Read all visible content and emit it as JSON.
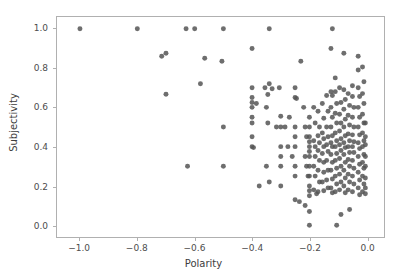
{
  "chart_data": {
    "type": "scatter",
    "title": "",
    "xlabel": "Polarity",
    "ylabel": "Subjectivity",
    "xlim": [
      -1.08,
      0.06
    ],
    "ylim": [
      -0.06,
      1.06
    ],
    "xticks": [
      -1.0,
      -0.8,
      -0.6,
      -0.4,
      -0.2,
      0.0
    ],
    "xticklabels": [
      "−1.0",
      "−0.8",
      "−0.6",
      "−0.4",
      "−0.2",
      "0.0"
    ],
    "yticks": [
      0.0,
      0.2,
      0.4,
      0.6,
      0.8,
      1.0
    ],
    "yticklabels": [
      "0.0",
      "0.2",
      "0.4",
      "0.6",
      "0.8",
      "1.0"
    ],
    "grid": false,
    "legend": null,
    "marker": {
      "shape": "circle",
      "color": "#555555",
      "size": 5,
      "opacity": 0.85
    },
    "series": [
      {
        "name": "reviews",
        "color": "#555555",
        "points": [
          [
            -1.0,
            1.0
          ],
          [
            -0.8,
            1.0
          ],
          [
            -0.63,
            1.0
          ],
          [
            -0.6,
            1.0
          ],
          [
            -0.5,
            1.0
          ],
          [
            -0.34,
            1.0
          ],
          [
            -0.12,
            1.0
          ],
          [
            -0.715,
            0.86
          ],
          [
            -0.7,
            0.875
          ],
          [
            -0.7,
            0.667
          ],
          [
            -0.565,
            0.85
          ],
          [
            -0.58,
            0.72
          ],
          [
            -0.505,
            0.835
          ],
          [
            -0.5,
            0.5
          ],
          [
            -0.625,
            0.3
          ],
          [
            -0.5,
            0.3
          ],
          [
            -0.4,
            0.9
          ],
          [
            -0.4,
            0.7
          ],
          [
            -0.4,
            0.65
          ],
          [
            -0.4,
            0.625
          ],
          [
            -0.4,
            0.6
          ],
          [
            -0.385,
            0.62
          ],
          [
            -0.4,
            0.55
          ],
          [
            -0.4,
            0.52
          ],
          [
            -0.4,
            0.45
          ],
          [
            -0.4,
            0.4
          ],
          [
            -0.395,
            0.395
          ],
          [
            -0.375,
            0.2
          ],
          [
            -0.355,
            0.7
          ],
          [
            -0.34,
            0.72
          ],
          [
            -0.33,
            0.695
          ],
          [
            -0.345,
            0.665
          ],
          [
            -0.35,
            0.6
          ],
          [
            -0.305,
            0.7
          ],
          [
            -0.3,
            0.555
          ],
          [
            -0.3,
            0.5
          ],
          [
            -0.315,
            0.5
          ],
          [
            -0.345,
            0.52
          ],
          [
            -0.35,
            0.3
          ],
          [
            -0.34,
            0.22
          ],
          [
            -0.3,
            0.4
          ],
          [
            -0.3,
            0.35
          ],
          [
            -0.3,
            0.3
          ],
          [
            -0.3,
            0.2
          ],
          [
            -0.285,
            0.5
          ],
          [
            -0.27,
            0.55
          ],
          [
            -0.275,
            0.4
          ],
          [
            -0.26,
            0.35
          ],
          [
            -0.25,
            0.7
          ],
          [
            -0.25,
            0.65
          ],
          [
            -0.245,
            0.645
          ],
          [
            -0.25,
            0.5
          ],
          [
            -0.25,
            0.45
          ],
          [
            -0.25,
            0.4
          ],
          [
            -0.25,
            0.3
          ],
          [
            -0.25,
            0.25
          ],
          [
            -0.25,
            0.13
          ],
          [
            -0.23,
            0.835
          ],
          [
            -0.235,
            0.12
          ],
          [
            -0.22,
            0.6
          ],
          [
            -0.215,
            0.5
          ],
          [
            -0.21,
            0.45
          ],
          [
            -0.215,
            0.35
          ],
          [
            -0.21,
            0.3
          ],
          [
            -0.205,
            0.25
          ],
          [
            -0.215,
            0.1
          ],
          [
            -0.2,
            0.55
          ],
          [
            -0.2,
            0.5
          ],
          [
            -0.2,
            0.45
          ],
          [
            -0.2,
            0.425
          ],
          [
            -0.2,
            0.4
          ],
          [
            -0.2,
            0.375
          ],
          [
            -0.2,
            0.35
          ],
          [
            -0.2,
            0.3
          ],
          [
            -0.2,
            0.25
          ],
          [
            -0.2,
            0.2
          ],
          [
            -0.2,
            0.175
          ],
          [
            -0.2,
            0.15
          ],
          [
            -0.2,
            0.07
          ],
          [
            -0.2,
            0.0
          ],
          [
            -0.185,
            0.6
          ],
          [
            -0.18,
            0.52
          ],
          [
            -0.185,
            0.43
          ],
          [
            -0.18,
            0.4
          ],
          [
            -0.18,
            0.35
          ],
          [
            -0.185,
            0.3
          ],
          [
            -0.18,
            0.25
          ],
          [
            -0.185,
            0.18
          ],
          [
            -0.175,
            0.16
          ],
          [
            -0.17,
            0.58
          ],
          [
            -0.165,
            0.5
          ],
          [
            -0.17,
            0.455
          ],
          [
            -0.165,
            0.42
          ],
          [
            -0.17,
            0.38
          ],
          [
            -0.165,
            0.33
          ],
          [
            -0.17,
            0.28
          ],
          [
            -0.165,
            0.22
          ],
          [
            -0.17,
            0.17
          ],
          [
            -0.155,
            0.62
          ],
          [
            -0.15,
            0.545
          ],
          [
            -0.155,
            0.47
          ],
          [
            -0.15,
            0.44
          ],
          [
            -0.15,
            0.4
          ],
          [
            -0.155,
            0.365
          ],
          [
            -0.15,
            0.32
          ],
          [
            -0.15,
            0.27
          ],
          [
            -0.155,
            0.22
          ],
          [
            -0.15,
            0.175
          ],
          [
            -0.14,
            0.66
          ],
          [
            -0.135,
            0.58
          ],
          [
            -0.14,
            0.5
          ],
          [
            -0.135,
            0.45
          ],
          [
            -0.14,
            0.41
          ],
          [
            -0.135,
            0.375
          ],
          [
            -0.14,
            0.33
          ],
          [
            -0.135,
            0.28
          ],
          [
            -0.14,
            0.23
          ],
          [
            -0.135,
            0.19
          ],
          [
            -0.125,
            0.9
          ],
          [
            -0.125,
            0.68
          ],
          [
            -0.12,
            0.66
          ],
          [
            -0.125,
            0.6
          ],
          [
            -0.12,
            0.55
          ],
          [
            -0.125,
            0.5
          ],
          [
            -0.12,
            0.455
          ],
          [
            -0.125,
            0.42
          ],
          [
            -0.12,
            0.4
          ],
          [
            -0.125,
            0.36
          ],
          [
            -0.12,
            0.32
          ],
          [
            -0.125,
            0.28
          ],
          [
            -0.12,
            0.235
          ],
          [
            -0.125,
            0.19
          ],
          [
            -0.12,
            0.165
          ],
          [
            -0.11,
            0.75
          ],
          [
            -0.11,
            0.68
          ],
          [
            -0.105,
            0.62
          ],
          [
            -0.11,
            0.57
          ],
          [
            -0.105,
            0.52
          ],
          [
            -0.11,
            0.47
          ],
          [
            -0.105,
            0.43
          ],
          [
            -0.11,
            0.4
          ],
          [
            -0.105,
            0.365
          ],
          [
            -0.11,
            0.33
          ],
          [
            -0.105,
            0.29
          ],
          [
            -0.11,
            0.25
          ],
          [
            -0.105,
            0.21
          ],
          [
            -0.11,
            0.17
          ],
          [
            -0.105,
            0.0
          ],
          [
            -0.095,
            0.7
          ],
          [
            -0.09,
            0.625
          ],
          [
            -0.095,
            0.565
          ],
          [
            -0.09,
            0.52
          ],
          [
            -0.095,
            0.48
          ],
          [
            -0.09,
            0.44
          ],
          [
            -0.095,
            0.41
          ],
          [
            -0.09,
            0.38
          ],
          [
            -0.095,
            0.34
          ],
          [
            -0.09,
            0.3
          ],
          [
            -0.095,
            0.26
          ],
          [
            -0.09,
            0.22
          ],
          [
            -0.095,
            0.18
          ],
          [
            -0.09,
            0.055
          ],
          [
            -0.08,
            0.875
          ],
          [
            -0.08,
            0.69
          ],
          [
            -0.075,
            0.64
          ],
          [
            -0.08,
            0.59
          ],
          [
            -0.075,
            0.54
          ],
          [
            -0.08,
            0.5
          ],
          [
            -0.075,
            0.455
          ],
          [
            -0.08,
            0.42
          ],
          [
            -0.075,
            0.395
          ],
          [
            -0.08,
            0.36
          ],
          [
            -0.075,
            0.32
          ],
          [
            -0.08,
            0.28
          ],
          [
            -0.075,
            0.24
          ],
          [
            -0.08,
            0.2
          ],
          [
            -0.075,
            0.165
          ],
          [
            -0.065,
            0.67
          ],
          [
            -0.06,
            0.61
          ],
          [
            -0.065,
            0.56
          ],
          [
            -0.06,
            0.51
          ],
          [
            -0.065,
            0.465
          ],
          [
            -0.06,
            0.43
          ],
          [
            -0.065,
            0.4
          ],
          [
            -0.06,
            0.37
          ],
          [
            -0.065,
            0.335
          ],
          [
            -0.06,
            0.3
          ],
          [
            -0.065,
            0.26
          ],
          [
            -0.06,
            0.22
          ],
          [
            -0.065,
            0.18
          ],
          [
            -0.06,
            0.08
          ],
          [
            -0.05,
            0.71
          ],
          [
            -0.05,
            0.655
          ],
          [
            -0.045,
            0.6
          ],
          [
            -0.05,
            0.55
          ],
          [
            -0.045,
            0.5
          ],
          [
            -0.05,
            0.46
          ],
          [
            -0.045,
            0.425
          ],
          [
            -0.05,
            0.4
          ],
          [
            -0.045,
            0.37
          ],
          [
            -0.05,
            0.33
          ],
          [
            -0.045,
            0.29
          ],
          [
            -0.05,
            0.25
          ],
          [
            -0.045,
            0.21
          ],
          [
            -0.05,
            0.17
          ],
          [
            -0.03,
            0.86
          ],
          [
            -0.03,
            0.79
          ],
          [
            -0.03,
            0.7
          ],
          [
            -0.025,
            0.655
          ],
          [
            -0.03,
            0.6
          ],
          [
            -0.025,
            0.55
          ],
          [
            -0.03,
            0.5
          ],
          [
            -0.025,
            0.46
          ],
          [
            -0.03,
            0.42
          ],
          [
            -0.025,
            0.39
          ],
          [
            -0.03,
            0.35
          ],
          [
            -0.025,
            0.31
          ],
          [
            -0.03,
            0.27
          ],
          [
            -0.025,
            0.23
          ],
          [
            -0.03,
            0.19
          ],
          [
            -0.025,
            0.155
          ],
          [
            -0.015,
            0.805
          ],
          [
            -0.01,
            0.73
          ],
          [
            -0.015,
            0.67
          ],
          [
            -0.01,
            0.62
          ],
          [
            -0.015,
            0.565
          ],
          [
            -0.01,
            0.52
          ],
          [
            -0.015,
            0.47
          ],
          [
            -0.01,
            0.43
          ],
          [
            -0.015,
            0.4
          ],
          [
            -0.01,
            0.36
          ],
          [
            -0.015,
            0.32
          ],
          [
            -0.01,
            0.29
          ],
          [
            -0.015,
            0.25
          ],
          [
            -0.01,
            0.21
          ],
          [
            -0.015,
            0.17
          ],
          [
            -0.005,
            0.52
          ],
          [
            -0.005,
            0.45
          ],
          [
            -0.005,
            0.41
          ],
          [
            -0.005,
            0.35
          ],
          [
            -0.005,
            0.3
          ],
          [
            -0.005,
            0.24
          ],
          [
            -0.005,
            0.19
          ],
          [
            -0.005,
            0.16
          ]
        ]
      }
    ]
  }
}
